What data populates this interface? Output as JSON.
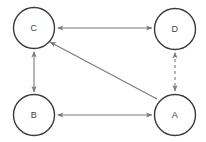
{
  "diagram": {
    "type": "node-link-graph",
    "background_color": "#ffffff",
    "node_stroke_color": "#3a3a3a",
    "node_fill_color": "#ffffff",
    "node_label_color": "#3d3d3d",
    "edge_color": "#7a7a7a",
    "node_radius": 20.5,
    "node_stroke_width": 1.4,
    "edge_stroke_width": 1.1,
    "nodes": [
      {
        "id": "C",
        "label": "C",
        "cx": 34,
        "cy": 28
      },
      {
        "id": "D",
        "label": "D",
        "cx": 175,
        "cy": 29
      },
      {
        "id": "B",
        "label": "B",
        "cx": 34,
        "cy": 115
      },
      {
        "id": "A",
        "label": "A",
        "cx": 175,
        "cy": 115
      }
    ],
    "edges": [
      {
        "id": "c-d",
        "from": "C",
        "to": "D",
        "style": "solid",
        "arrowheads": "both",
        "x1": 58,
        "y1": 28,
        "x2": 152,
        "y2": 28
      },
      {
        "id": "c-b",
        "from": "C",
        "to": "B",
        "style": "solid",
        "arrowheads": "both",
        "x1": 34,
        "y1": 52,
        "x2": 34,
        "y2": 92
      },
      {
        "id": "b-a",
        "from": "B",
        "to": "A",
        "style": "solid",
        "arrowheads": "both",
        "x1": 58,
        "y1": 115,
        "x2": 152,
        "y2": 115
      },
      {
        "id": "d-a",
        "from": "D",
        "to": "A",
        "style": "dashed",
        "arrowheads": "both",
        "x1": 175,
        "y1": 53,
        "x2": 175,
        "y2": 91
      },
      {
        "id": "a-c",
        "from": "A",
        "to": "C",
        "style": "solid",
        "arrowheads": "target",
        "x1": 157,
        "y1": 99,
        "x2": 50,
        "y2": 42
      }
    ]
  }
}
